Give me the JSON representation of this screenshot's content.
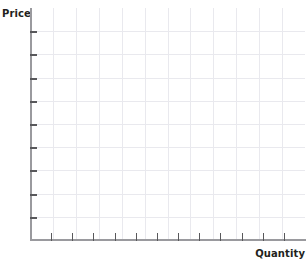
{
  "chart_data": {
    "type": "line",
    "title": "",
    "subtitle": "",
    "xlabel": "Quantity",
    "ylabel": "Price",
    "series": [],
    "categories": [],
    "x": [],
    "values": [],
    "annotations": [],
    "legend": {
      "entries": [],
      "position": "none",
      "visible": false
    },
    "grid": {
      "visible": true,
      "horizontal_lines": 9,
      "vertical_lines": 11,
      "color": "#e9e9ee"
    },
    "axes": {
      "x": {
        "label": "Quantity",
        "tick_labels": [],
        "tick_count": 12,
        "range_labeled": false,
        "line_color": "#9a9a9e",
        "tick_color": "#58585b"
      },
      "y": {
        "label": "Price",
        "tick_labels": [],
        "tick_count": 9,
        "range_labeled": false,
        "line_color": "#9a9a9e",
        "tick_color": "#58585b"
      }
    }
  },
  "labels": {
    "y_axis_title": "Price",
    "x_axis_title": "Quantity"
  },
  "colors": {
    "background": "#ffffff",
    "axis": "#9a9a9e",
    "tick": "#58585b",
    "grid": "#e9e9ee",
    "text": "#231f20"
  }
}
